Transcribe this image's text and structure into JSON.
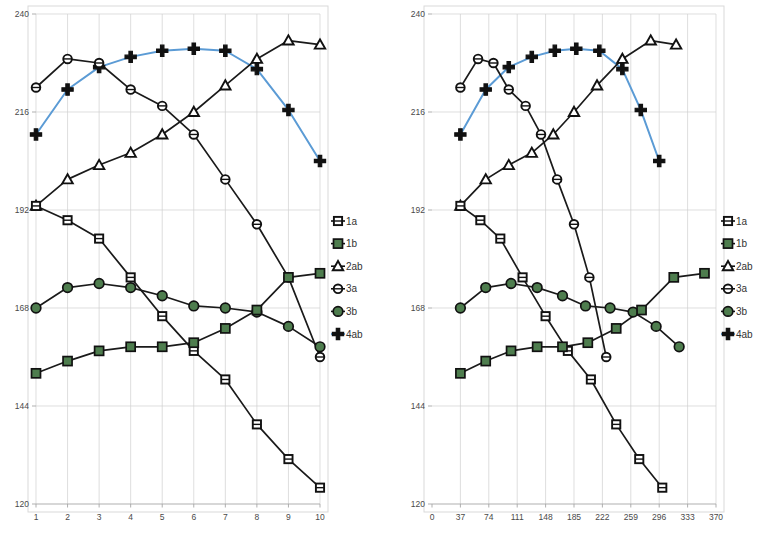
{
  "figure": {
    "panels": [
      {
        "id": "left-panel",
        "x_axis": {
          "ticks": [
            "1",
            "2",
            "3",
            "4",
            "5",
            "6",
            "7",
            "8",
            "9",
            "10"
          ],
          "min": 1,
          "max": 10
        },
        "y_axis": {
          "ticks": [
            "240",
            "216",
            "192",
            "168",
            "144",
            "120"
          ],
          "min": 120,
          "max": 240
        },
        "legend": {
          "position": "right",
          "items": [
            {
              "label": "1a",
              "marker": "square-open",
              "color": "#ffffff",
              "line_color": "#111111"
            },
            {
              "label": "1b",
              "marker": "square-filled",
              "color": "#4e7d4e",
              "line_color": "#111111"
            },
            {
              "label": "2ab",
              "marker": "triangle-open",
              "color": "#ffffff",
              "line_color": "#111111"
            },
            {
              "label": "3a",
              "marker": "circle-open",
              "color": "#ffffff",
              "line_color": "#111111"
            },
            {
              "label": "3b",
              "marker": "circle-filled",
              "color": "#4e7d4e",
              "line_color": "#111111"
            },
            {
              "label": "4ab",
              "marker": "plus",
              "color": "#111111",
              "line_color": "#5b9bd5"
            }
          ]
        }
      },
      {
        "id": "right-panel",
        "x_axis": {
          "ticks": [
            "0",
            "37",
            "74",
            "111",
            "148",
            "185",
            "222",
            "259",
            "296",
            "333",
            "370"
          ],
          "min": 0,
          "max": 370
        },
        "y_axis": {
          "ticks": [
            "240",
            "216",
            "192",
            "168",
            "144",
            "120"
          ],
          "min": 120,
          "max": 240
        },
        "legend": {
          "position": "right",
          "items": [
            {
              "label": "1a",
              "marker": "square-open",
              "color": "#ffffff",
              "line_color": "#111111"
            },
            {
              "label": "1b",
              "marker": "square-filled",
              "color": "#4e7d4e",
              "line_color": "#111111"
            },
            {
              "label": "2ab",
              "marker": "triangle-open",
              "color": "#ffffff",
              "line_color": "#111111"
            },
            {
              "label": "3a",
              "marker": "circle-open",
              "color": "#ffffff",
              "line_color": "#111111"
            },
            {
              "label": "3b",
              "marker": "circle-filled",
              "color": "#4e7d4e",
              "line_color": "#111111"
            },
            {
              "label": "4ab",
              "marker": "plus",
              "color": "#111111",
              "line_color": "#5b9bd5"
            }
          ]
        }
      }
    ]
  },
  "chart_data": [
    {
      "type": "line",
      "title": "",
      "xlabel": "",
      "ylabel": "",
      "xlim": [
        1,
        10
      ],
      "ylim": [
        120,
        240
      ],
      "grid": true,
      "legend_position": "right",
      "xticks": [
        1,
        2,
        3,
        4,
        5,
        6,
        7,
        8,
        9,
        10
      ],
      "yticks": [
        120,
        144,
        168,
        192,
        216,
        240
      ],
      "categories": [
        1,
        2,
        3,
        4,
        5,
        6,
        7,
        8,
        9,
        10
      ],
      "series": [
        {
          "name": "1a",
          "marker": "square-open",
          "color": "#111111",
          "values": [
            193.0,
            189.5,
            185.0,
            175.5,
            166.0,
            157.5,
            150.5,
            139.5,
            131.0,
            124.0
          ]
        },
        {
          "name": "1b",
          "marker": "square-filled",
          "color": "#4e7d4e",
          "values": [
            152.0,
            155.0,
            157.5,
            158.5,
            158.5,
            159.5,
            163.0,
            167.5,
            175.5,
            176.5
          ]
        },
        {
          "name": "2ab",
          "marker": "triangle-open",
          "color": "#111111",
          "values": [
            193.0,
            199.5,
            203.0,
            206.0,
            210.5,
            216.0,
            222.5,
            229.0,
            233.5,
            232.5
          ]
        },
        {
          "name": "3a",
          "marker": "circle-open",
          "color": "#111111",
          "values": [
            222.0,
            229.0,
            228.0,
            221.5,
            217.5,
            210.5,
            199.5,
            188.5,
            175.5,
            156.0
          ]
        },
        {
          "name": "3b",
          "marker": "circle-filled",
          "color": "#4e7d4e",
          "values": [
            168.0,
            173.0,
            174.0,
            173.0,
            171.0,
            168.5,
            168.0,
            167.0,
            163.5,
            158.5
          ]
        },
        {
          "name": "4ab",
          "marker": "plus",
          "color": "#5b9bd5",
          "values": [
            210.5,
            221.5,
            227.0,
            229.5,
            231.0,
            231.5,
            231.0,
            226.5,
            216.5,
            204.0
          ]
        }
      ]
    },
    {
      "type": "line",
      "title": "",
      "xlabel": "",
      "ylabel": "",
      "xlim": [
        0,
        370
      ],
      "ylim": [
        120,
        240
      ],
      "grid": true,
      "legend_position": "right",
      "xticks": [
        0,
        37,
        74,
        111,
        148,
        185,
        222,
        259,
        296,
        333,
        370
      ],
      "yticks": [
        120,
        144,
        168,
        192,
        216,
        240
      ],
      "series": [
        {
          "name": "1a",
          "marker": "square-open",
          "color": "#111111",
          "x": [
            37,
            63,
            89,
            118,
            148,
            177,
            207,
            240,
            270,
            300
          ],
          "values": [
            193.0,
            189.5,
            185.0,
            175.5,
            166.0,
            157.5,
            150.5,
            139.5,
            131.0,
            124.0
          ]
        },
        {
          "name": "1b",
          "marker": "square-filled",
          "color": "#4e7d4e",
          "x": [
            37,
            70,
            103,
            137,
            170,
            203,
            240,
            273,
            315,
            355
          ],
          "values": [
            152.0,
            155.0,
            157.5,
            158.5,
            158.5,
            159.5,
            163.0,
            167.5,
            175.5,
            176.5
          ]
        },
        {
          "name": "2ab",
          "marker": "triangle-open",
          "color": "#111111",
          "x": [
            37,
            70,
            100,
            130,
            158,
            185,
            215,
            248,
            285,
            318
          ],
          "values": [
            193.0,
            199.5,
            203.0,
            206.0,
            210.5,
            216.0,
            222.5,
            229.0,
            233.5,
            232.5
          ]
        },
        {
          "name": "3a",
          "marker": "circle-open",
          "color": "#111111",
          "x": [
            37,
            60,
            80,
            100,
            122,
            142,
            163,
            185,
            205,
            227
          ],
          "values": [
            222.0,
            229.0,
            228.0,
            221.5,
            217.5,
            210.5,
            199.5,
            188.5,
            175.5,
            156.0
          ]
        },
        {
          "name": "3b",
          "marker": "circle-filled",
          "color": "#4e7d4e",
          "x": [
            37,
            70,
            103,
            137,
            170,
            200,
            232,
            262,
            292,
            322
          ],
          "values": [
            168.0,
            173.0,
            174.0,
            173.0,
            171.0,
            168.5,
            168.0,
            167.0,
            163.5,
            158.5
          ]
        },
        {
          "name": "4ab",
          "marker": "plus",
          "color": "#5b9bd5",
          "x": [
            37,
            70,
            100,
            130,
            160,
            188,
            218,
            248,
            272,
            296
          ],
          "values": [
            210.5,
            221.5,
            227.0,
            229.5,
            231.0,
            231.5,
            231.0,
            226.5,
            216.5,
            204.0
          ]
        }
      ]
    }
  ]
}
